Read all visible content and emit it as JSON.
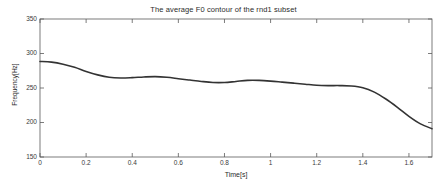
{
  "chart_data": {
    "type": "line",
    "title": "The average F0 contour of the rnd1 subset",
    "xlabel": "Time[s]",
    "ylabel": "Frequency[Hz]",
    "xlim": [
      0,
      1.7
    ],
    "ylim": [
      150,
      350
    ],
    "grid": false,
    "legend": null,
    "xticks": [
      0,
      0.2,
      0.4,
      0.6,
      0.8,
      1,
      1.2,
      1.4,
      1.6
    ],
    "xtick_labels": [
      "0",
      "0.2",
      "0.4",
      "0.6",
      "0.8",
      "1",
      "1.2",
      "1.4",
      "1.6"
    ],
    "yticks": [
      150,
      200,
      250,
      300,
      350
    ],
    "ytick_labels": [
      "150",
      "200",
      "250",
      "300",
      "350"
    ],
    "series": [
      {
        "name": "average F0 contour",
        "color": "#333333",
        "x": [
          0.0,
          0.05,
          0.1,
          0.15,
          0.2,
          0.25,
          0.3,
          0.35,
          0.4,
          0.45,
          0.5,
          0.55,
          0.6,
          0.65,
          0.7,
          0.75,
          0.8,
          0.85,
          0.9,
          0.95,
          1.0,
          1.05,
          1.1,
          1.15,
          1.2,
          1.25,
          1.3,
          1.35,
          1.4,
          1.45,
          1.5,
          1.55,
          1.6,
          1.65,
          1.7
        ],
        "values": [
          288.5,
          287.5,
          284.5,
          280.0,
          274.0,
          269.0,
          265.5,
          264.5,
          265.0,
          266.0,
          266.5,
          265.5,
          263.5,
          261.5,
          259.5,
          258.0,
          258.0,
          259.5,
          261.0,
          261.0,
          260.0,
          258.5,
          257.0,
          255.5,
          254.0,
          253.5,
          253.5,
          253.0,
          250.5,
          244.0,
          234.0,
          222.0,
          209.0,
          198.0,
          191.0
        ]
      }
    ]
  },
  "axes": {
    "frame_color": "#555555",
    "line_color": "#333333",
    "background": "#ffffff"
  }
}
